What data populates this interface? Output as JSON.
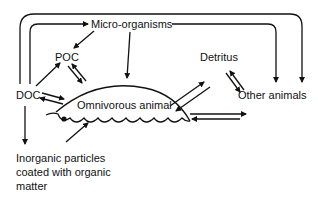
{
  "diagram": {
    "nodes": {
      "micro_organisms": "Micro-organisms",
      "poc": "POC",
      "doc": "DOC",
      "detritus": "Detritus",
      "omnivorous_animal": "Omnivorous animal",
      "other_animals": "Other animals",
      "inorganic_particles": [
        "Inorganic particles",
        "coated with organic",
        "matter"
      ]
    },
    "edges": [
      {
        "from": "DOC",
        "to": "Micro-organisms"
      },
      {
        "from": "DOC",
        "to": "Other animals"
      },
      {
        "from": "Micro-organisms",
        "to": "Other animals"
      },
      {
        "from": "Micro-organisms",
        "to": "POC"
      },
      {
        "from": "Micro-organisms",
        "to": "Omnivorous animal"
      },
      {
        "from": "DOC",
        "to": "POC"
      },
      {
        "from": "POC",
        "to": "Omnivorous animal",
        "bidirectional": true
      },
      {
        "from": "DOC",
        "to": "Omnivorous animal",
        "bidirectional": true
      },
      {
        "from": "Detritus",
        "to": "Omnivorous animal",
        "bidirectional": true
      },
      {
        "from": "Detritus",
        "to": "Other animals",
        "bidirectional": true
      },
      {
        "from": "Omnivorous animal",
        "to": "Other animals",
        "bidirectional": true
      },
      {
        "from": "DOC",
        "to": "Inorganic particles coated with organic matter"
      },
      {
        "from": "Inorganic particles coated with organic matter",
        "to": "Omnivorous animal"
      }
    ]
  }
}
